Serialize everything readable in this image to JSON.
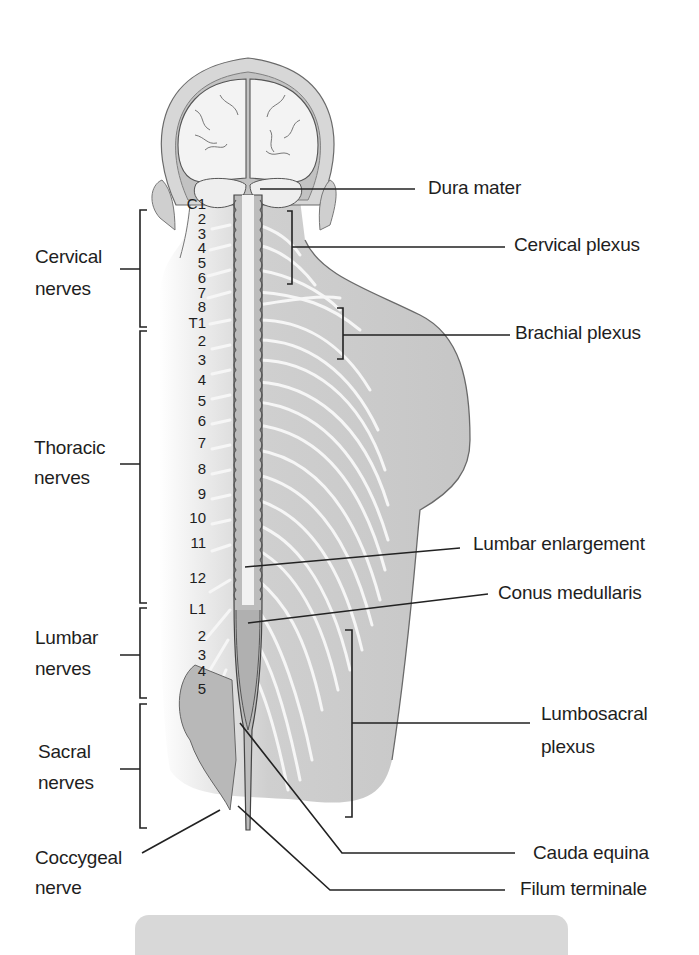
{
  "figure": {
    "colors": {
      "background": "#ffffff",
      "body_fill": "#c8c8c8",
      "nerve": "#f4f4f4",
      "outline": "#555555",
      "leader_line": "#222222",
      "caption_box": "#d8d8d8"
    }
  },
  "labels_right": {
    "dura_mater": "Dura mater",
    "cervical_plexus": "Cervical plexus",
    "brachial_plexus": "Brachial plexus",
    "lumbar_enlargement": "Lumbar enlargement",
    "conus_medullaris": "Conus medullaris",
    "lumbosacral_plexus_1": "Lumbosacral",
    "lumbosacral_plexus_2": "plexus",
    "cauda_equina": "Cauda equina",
    "filum_terminale": "Filum terminale"
  },
  "labels_left": {
    "cervical_1": "Cervical",
    "cervical_2": "nerves",
    "thoracic_1": "Thoracic",
    "thoracic_2": "nerves",
    "lumbar_1": "Lumbar",
    "lumbar_2": "nerves",
    "sacral_1": "Sacral",
    "sacral_2": "nerves",
    "coccygeal_1": "Coccygeal",
    "coccygeal_2": "nerve"
  },
  "segments": [
    {
      "label": "C1",
      "y": 203
    },
    {
      "label": "2",
      "y": 218
    },
    {
      "label": "3",
      "y": 233
    },
    {
      "label": "4",
      "y": 247
    },
    {
      "label": "5",
      "y": 262
    },
    {
      "label": "6",
      "y": 277
    },
    {
      "label": "7",
      "y": 292
    },
    {
      "label": "8",
      "y": 306
    },
    {
      "label": "T1",
      "y": 322
    },
    {
      "label": "2",
      "y": 340
    },
    {
      "label": "3",
      "y": 359
    },
    {
      "label": "4",
      "y": 379
    },
    {
      "label": "5",
      "y": 400
    },
    {
      "label": "6",
      "y": 420
    },
    {
      "label": "7",
      "y": 442
    },
    {
      "label": "8",
      "y": 468
    },
    {
      "label": "9",
      "y": 493
    },
    {
      "label": "10",
      "y": 517
    },
    {
      "label": "11",
      "y": 542
    },
    {
      "label": "12",
      "y": 577
    },
    {
      "label": "L1",
      "y": 608
    },
    {
      "label": "2",
      "y": 635
    },
    {
      "label": "3",
      "y": 654
    },
    {
      "label": "4",
      "y": 670
    },
    {
      "label": "5",
      "y": 688
    }
  ]
}
